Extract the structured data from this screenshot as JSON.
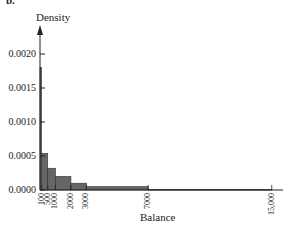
{
  "figure": {
    "panel_label": "b.",
    "y_axis_label": "Density",
    "x_axis_label": "Balance"
  },
  "chart_data": {
    "type": "bar",
    "title": "",
    "panel_label": "b.",
    "xlabel": "Balance",
    "ylabel": "Density",
    "histogram": true,
    "bins": [
      {
        "from": 0,
        "to": 100,
        "density": 0.0018
      },
      {
        "from": 100,
        "to": 500,
        "density": 0.00054
      },
      {
        "from": 500,
        "to": 1000,
        "density": 0.00032
      },
      {
        "from": 1000,
        "to": 2000,
        "density": 0.0002
      },
      {
        "from": 2000,
        "to": 3000,
        "density": 0.0001
      },
      {
        "from": 3000,
        "to": 7000,
        "density": 5e-05
      },
      {
        "from": 7000,
        "to": 15000,
        "density": 1e-05
      }
    ],
    "categories": [
      "0-100",
      "100-500",
      "500-1000",
      "1000-2000",
      "2000-3000",
      "3000-7000",
      "7000-15000"
    ],
    "values": [
      0.0018,
      0.00054,
      0.00032,
      0.0002,
      0.0001,
      5e-05,
      1e-05
    ],
    "x_ticks": [
      "100",
      "500",
      "1000",
      "2000",
      "3000",
      "7000",
      "15,000"
    ],
    "x_tick_values": [
      100,
      500,
      1000,
      2000,
      3000,
      7000,
      15000
    ],
    "y_ticks": [
      "0.0000",
      "0.0005",
      "0.0010",
      "0.0015",
      "0.0020"
    ],
    "y_tick_values": [
      0,
      0.0005,
      0.001,
      0.0015,
      0.002
    ],
    "xlim": [
      0,
      15500
    ],
    "ylim": [
      0,
      0.0022
    ],
    "grid": false,
    "legend": null,
    "bar_color": "#666666"
  }
}
